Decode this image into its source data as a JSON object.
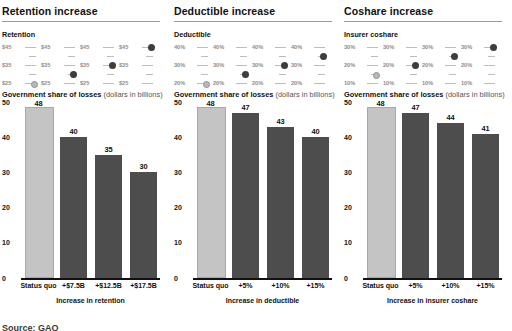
{
  "source_note": "Source: GAO",
  "panels": [
    {
      "title": "Retention increase",
      "scale_label": "Retention",
      "scale_ticks": [
        "$45",
        "$35",
        "$25"
      ],
      "chart_heading_bold": "Government share of losses",
      "chart_heading_light": "(dollars in billions)",
      "axis_title": "Increase in retention",
      "chart_data": {
        "type": "bar",
        "title": "Government share of losses (dollars in billions)",
        "xlabel": "Increase in retention",
        "ylabel": "",
        "categories": [
          "Status quo",
          "+$7.5B",
          "+$12.5B",
          "+$17.5B"
        ],
        "values": [
          48,
          40,
          35,
          30
        ],
        "ylim": [
          0,
          50
        ],
        "yticks": [
          0,
          10,
          20,
          30,
          40,
          50
        ],
        "grid": false,
        "legend": "none",
        "scale_indicator": {
          "label": "Retention",
          "ticks": [
            "$45",
            "$35",
            "$25"
          ],
          "dot_values": [
            "$25",
            "$35",
            "$40",
            "$45"
          ]
        }
      }
    },
    {
      "title": "Deductible increase",
      "scale_label": "Deductible",
      "scale_ticks": [
        "40%",
        "30%",
        "20%"
      ],
      "chart_heading_bold": "Government share of losses",
      "chart_heading_light": "(dollars in billions)",
      "axis_title": "Increase in deductible",
      "chart_data": {
        "type": "bar",
        "title": "Government share of losses (dollars in billions)",
        "xlabel": "Increase in deductible",
        "ylabel": "",
        "categories": [
          "Status quo",
          "+5%",
          "+10%",
          "+15%"
        ],
        "values": [
          48,
          47,
          43,
          40
        ],
        "ylim": [
          0,
          50
        ],
        "yticks": [
          0,
          10,
          20,
          30,
          40,
          50
        ],
        "grid": false,
        "legend": "none",
        "scale_indicator": {
          "label": "Deductible",
          "ticks": [
            "40%",
            "30%",
            "20%"
          ],
          "dot_values": [
            "20%",
            "25%",
            "30%",
            "35%"
          ]
        }
      }
    },
    {
      "title": "Coshare increase",
      "scale_label": "Insurer coshare",
      "scale_ticks": [
        "30%",
        "20%",
        "10%"
      ],
      "chart_heading_bold": "Government share of losses",
      "chart_heading_light": "(dollars in billions)",
      "axis_title": "Increase in insurer coshare",
      "chart_data": {
        "type": "bar",
        "title": "Government share of losses (dollars in billions)",
        "xlabel": "Increase in insurer coshare",
        "ylabel": "",
        "categories": [
          "Status quo",
          "+5%",
          "+10%",
          "+15%"
        ],
        "values": [
          48,
          47,
          44,
          41
        ],
        "ylim": [
          0,
          50
        ],
        "yticks": [
          0,
          10,
          20,
          30,
          40,
          50
        ],
        "grid": false,
        "legend": "none",
        "scale_indicator": {
          "label": "Insurer coshare",
          "ticks": [
            "30%",
            "20%",
            "10%"
          ],
          "dot_values": [
            "15%",
            "20%",
            "25%",
            "30%"
          ]
        }
      }
    }
  ]
}
